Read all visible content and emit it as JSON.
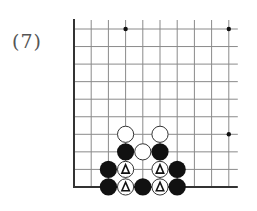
{
  "problem": {
    "label": "(7)"
  },
  "board": {
    "origin_x": 74,
    "origin_y": 29,
    "spacing_x": 17.2,
    "spacing_y": 17.55,
    "cols": 10,
    "rows": 10,
    "top_extend": 9,
    "right_extend": 9,
    "edges": [
      "left",
      "bottom"
    ],
    "line_color": "#8a8a8a",
    "edge_color": "#333333",
    "star_points": [
      {
        "col": 3,
        "row": 0
      },
      {
        "col": 9,
        "row": 0
      },
      {
        "col": 9,
        "row": 6
      }
    ],
    "stones": [
      {
        "col": 3,
        "row": 6,
        "color": "white",
        "mark": ""
      },
      {
        "col": 5,
        "row": 6,
        "color": "white",
        "mark": ""
      },
      {
        "col": 3,
        "row": 7,
        "color": "black",
        "mark": ""
      },
      {
        "col": 4,
        "row": 7,
        "color": "white",
        "mark": ""
      },
      {
        "col": 5,
        "row": 7,
        "color": "black",
        "mark": ""
      },
      {
        "col": 2,
        "row": 8,
        "color": "black",
        "mark": ""
      },
      {
        "col": 3,
        "row": 8,
        "color": "white",
        "mark": "triangle"
      },
      {
        "col": 5,
        "row": 8,
        "color": "white",
        "mark": "triangle"
      },
      {
        "col": 6,
        "row": 8,
        "color": "black",
        "mark": ""
      },
      {
        "col": 2,
        "row": 9,
        "color": "black",
        "mark": ""
      },
      {
        "col": 3,
        "row": 9,
        "color": "white",
        "mark": "triangle"
      },
      {
        "col": 4,
        "row": 9,
        "color": "black",
        "mark": ""
      },
      {
        "col": 5,
        "row": 9,
        "color": "white",
        "mark": "triangle"
      },
      {
        "col": 6,
        "row": 9,
        "color": "black",
        "mark": ""
      }
    ],
    "colors": {
      "black_stone": "#111111",
      "white_stone": "#ffffff",
      "white_stone_border": "#333333",
      "mark": "#111111"
    }
  }
}
